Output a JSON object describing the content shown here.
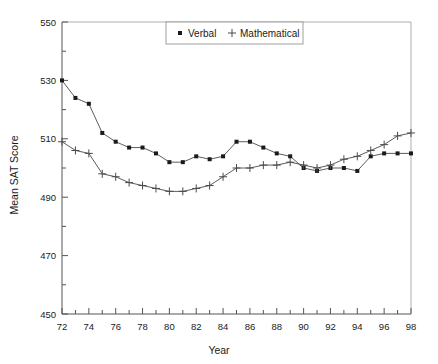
{
  "chart_data": {
    "type": "line",
    "title": "",
    "xlabel": "Year",
    "ylabel": "Mean SAT Score",
    "xlim": [
      72,
      98
    ],
    "ylim": [
      450,
      550
    ],
    "y_ticks": [
      450,
      470,
      490,
      510,
      530,
      550
    ],
    "y_minor_step": 10,
    "x_ticks": [
      72,
      74,
      76,
      78,
      80,
      82,
      84,
      86,
      88,
      90,
      92,
      94,
      96,
      98
    ],
    "x_minor_step": 1,
    "grid": false,
    "legend_position": "top-center",
    "x": [
      72,
      73,
      74,
      75,
      76,
      77,
      78,
      79,
      80,
      81,
      82,
      83,
      84,
      85,
      86,
      87,
      88,
      89,
      90,
      91,
      92,
      93,
      94,
      95,
      96,
      97,
      98
    ],
    "series": [
      {
        "name": "Verbal",
        "marker": "filled-square",
        "values": [
          530,
          524,
          522,
          512,
          509,
          507,
          507,
          505,
          502,
          502,
          504,
          503,
          504,
          509,
          509,
          507,
          505,
          504,
          500,
          499,
          500,
          500,
          499,
          504,
          505,
          505,
          505
        ]
      },
      {
        "name": "Mathematical",
        "marker": "plus",
        "values": [
          509,
          506,
          505,
          498,
          497,
          495,
          494,
          493,
          492,
          492,
          493,
          494,
          497,
          500,
          500,
          501,
          501,
          502,
          501,
          500,
          501,
          503,
          504,
          506,
          508,
          511,
          512
        ]
      }
    ],
    "legend": [
      {
        "label": "Verbal",
        "marker": "filled-square"
      },
      {
        "label": "Mathematical",
        "marker": "plus"
      }
    ]
  },
  "colors": {
    "line": "#4a4a4a",
    "marker": "#1a1a1a",
    "axis": "#555555",
    "background": "#ffffff"
  }
}
